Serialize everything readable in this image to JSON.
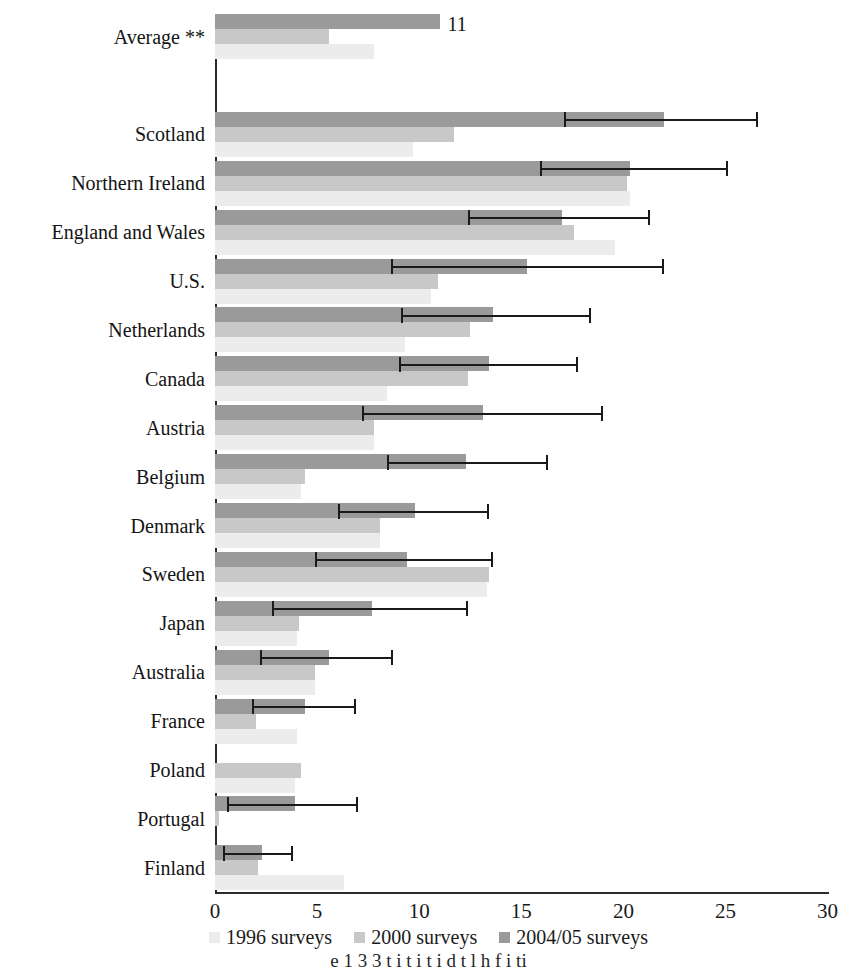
{
  "chart_data": {
    "type": "bar",
    "orientation": "horizontal",
    "title": "",
    "xlabel": "",
    "ylabel": "",
    "xlim": [
      0,
      30
    ],
    "xticks": [
      0,
      5,
      10,
      15,
      20,
      25,
      30
    ],
    "grid": false,
    "legend_position": "bottom",
    "categories": [
      "Average **",
      "",
      "Scotland",
      "Northern Ireland",
      "England and Wales",
      "U.S.",
      "Netherlands",
      "Canada",
      "Austria",
      "Belgium",
      "Denmark",
      "Sweden",
      "Japan",
      "Australia",
      "France",
      "Poland",
      "Portugal",
      "Finland"
    ],
    "series": [
      {
        "name": "1996 surveys",
        "color": "#ececec",
        "values": [
          7.8,
          null,
          9.7,
          20.3,
          19.6,
          10.6,
          9.3,
          8.4,
          7.8,
          4.2,
          8.1,
          13.3,
          4.0,
          4.9,
          4.0,
          3.9,
          0.0,
          6.3
        ]
      },
      {
        "name": "2000 surveys",
        "color": "#c8c8c8",
        "values": [
          5.6,
          null,
          11.7,
          20.2,
          17.6,
          10.9,
          12.5,
          12.4,
          7.8,
          4.4,
          8.1,
          13.4,
          4.1,
          4.9,
          2.0,
          4.2,
          0.2,
          2.1
        ]
      },
      {
        "name": "2004/05 surveys",
        "color": "#9a9a9a",
        "values": [
          11.0,
          null,
          22.0,
          20.3,
          17.0,
          15.3,
          13.6,
          13.4,
          13.1,
          12.3,
          9.8,
          9.4,
          7.7,
          5.6,
          4.4,
          null,
          3.9,
          2.3
        ]
      }
    ],
    "error_bars": {
      "series": "2004/05 surveys",
      "intervals": [
        null,
        null,
        {
          "low": 17.1,
          "high": 26.6
        },
        {
          "low": 15.9,
          "high": 25.1
        },
        {
          "low": 12.4,
          "high": 21.3
        },
        {
          "low": 8.6,
          "high": 22.0
        },
        {
          "low": 9.1,
          "high": 18.4
        },
        {
          "low": 9.0,
          "high": 17.8
        },
        {
          "low": 7.2,
          "high": 19.0
        },
        {
          "low": 8.4,
          "high": 16.3
        },
        {
          "low": 6.0,
          "high": 13.4
        },
        {
          "low": 4.9,
          "high": 13.6
        },
        {
          "low": 2.8,
          "high": 12.4
        },
        {
          "low": 2.2,
          "high": 8.7
        },
        {
          "low": 1.8,
          "high": 6.9
        },
        null,
        {
          "low": 0.6,
          "high": 7.0
        },
        {
          "low": 0.4,
          "high": 3.8
        }
      ]
    },
    "data_labels": [
      {
        "category": "Average **",
        "series": "2004/05 surveys",
        "text": "11"
      }
    ],
    "legend": [
      "1996 surveys",
      "2000 surveys",
      "2004/05 surveys"
    ]
  },
  "axis": {
    "tick_labels": [
      "0",
      "5",
      "10",
      "15",
      "20",
      "25",
      "30"
    ]
  },
  "legend": {
    "items": [
      {
        "label": "1996 surveys",
        "swatch": "#ececec"
      },
      {
        "label": "2000 surveys",
        "swatch": "#c8c8c8"
      },
      {
        "label": "2004/05 surveys",
        "swatch": "#9a9a9a"
      }
    ]
  },
  "caption": {
    "text": "e  1 3  3    t  i     t  i     t  i     d  t  l  h      f  i  ti"
  },
  "colors": {
    "series_1996": "#ececec",
    "series_2000": "#c8c8c8",
    "series_2004": "#9a9a9a",
    "axis": "#2b2b2b",
    "text": "#141414",
    "error_bar": "#1a1a1a"
  }
}
